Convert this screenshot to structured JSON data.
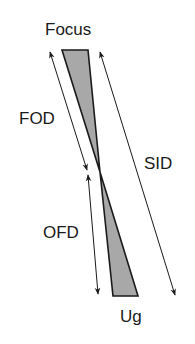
{
  "diagram": {
    "type": "x-ray geometric unsharpness diagram",
    "labels": {
      "focus": "Focus",
      "fod": "FOD",
      "sid": "SID",
      "ofd": "OFD",
      "ug": "Ug"
    },
    "colors": {
      "fill": "#a8a8a8",
      "stroke": "#1a1a1a",
      "background": "#ffffff"
    }
  }
}
